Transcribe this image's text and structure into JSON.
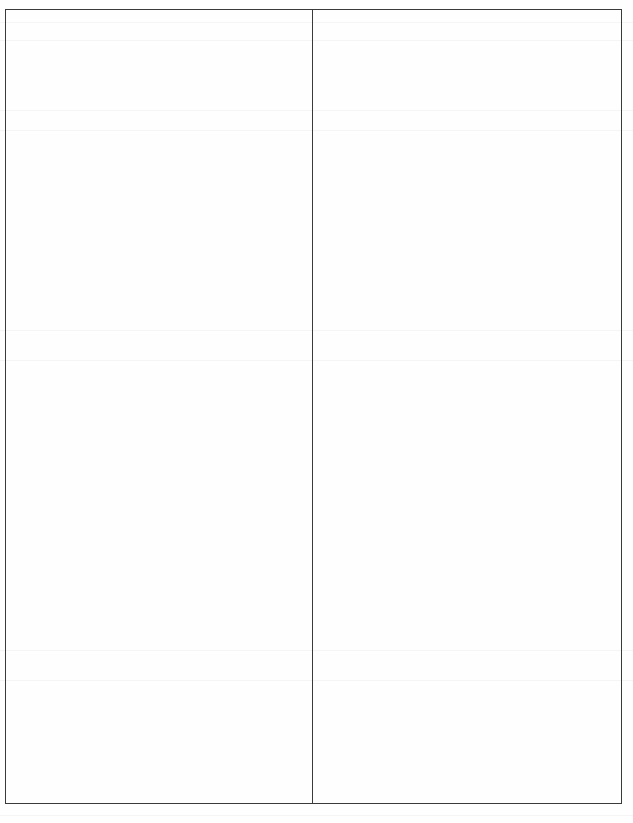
{
  "document": {
    "type": "blank two-column table form",
    "table": {
      "columns": 2,
      "rows": 1,
      "cells": [
        {
          "column": "left",
          "text": ""
        },
        {
          "column": "right",
          "text": ""
        }
      ]
    },
    "note": ""
  },
  "colors": {
    "border": "#3a3a3a",
    "paper": "#fefefe"
  }
}
